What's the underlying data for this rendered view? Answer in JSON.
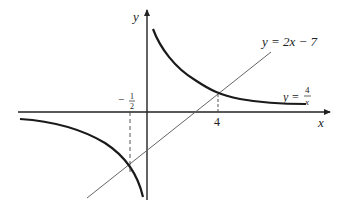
{
  "diagram": {
    "axes": {
      "x_label": "x",
      "y_label": "y"
    },
    "curves": [
      {
        "name": "hyperbola",
        "equation_lhs": "y =",
        "numerator": "4",
        "denominator": "x"
      },
      {
        "name": "line",
        "equation": "y = 2x − 7"
      }
    ],
    "ticks": {
      "neg_half_sign": "−",
      "neg_half_num": "1",
      "neg_half_den": "2",
      "four": "4"
    },
    "intersections": [
      {
        "x": "-1/2",
        "y": "-8"
      },
      {
        "x": "4",
        "y": "1"
      }
    ],
    "colors": {
      "curve": "#1a1a1a",
      "line": "#666666",
      "axis": "#222222"
    }
  }
}
